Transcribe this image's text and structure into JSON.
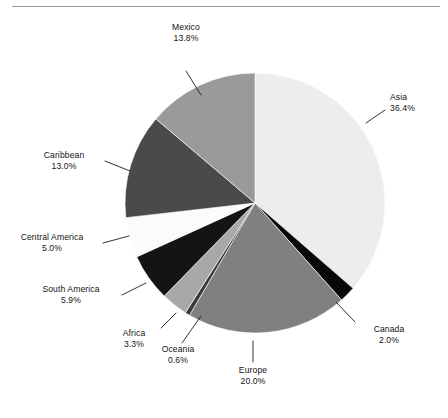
{
  "figure": {
    "background_color": "#ffffff",
    "rule_color": "#9a9a9a",
    "label_text_color": "#141414",
    "leader_color": "#1d1d1d"
  },
  "caption": {
    "text": ""
  },
  "chart_data": {
    "type": "pie",
    "title": "",
    "subtitle": "",
    "xlabel": "",
    "ylabel": "",
    "legend_position": "none",
    "grid": false,
    "start_angle_deg": 0,
    "direction": "clockwise",
    "center": {
      "x": 255,
      "y": 203
    },
    "radius": 130,
    "units": "percent",
    "total": 100.0,
    "categories": [
      "Asia",
      "Canada",
      "Europe",
      "Oceania",
      "Africa",
      "South America",
      "Central America",
      "Caribbean",
      "Mexico"
    ],
    "values": [
      36.4,
      2.0,
      20.0,
      0.6,
      3.3,
      5.9,
      5.0,
      13.0,
      13.8
    ],
    "value_labels": [
      "36.4%",
      "2.0%",
      "20.0%",
      "0.6%",
      "3.3%",
      "5.9%",
      "5.0%",
      "13.0%",
      "13.8%"
    ],
    "colors": [
      "#ededed",
      "#080808",
      "#808080",
      "#3a3a3a",
      "#a8a8a8",
      "#141414",
      "#fbfbfb",
      "#4a4a4a",
      "#9a9a9a"
    ],
    "slices": [
      {
        "name": "Asia",
        "value": 36.4,
        "label": "Asia",
        "value_label": "36.4%",
        "color": "#ededed"
      },
      {
        "name": "Canada",
        "value": 2.0,
        "label": "Canada",
        "value_label": "2.0%",
        "color": "#080808"
      },
      {
        "name": "Europe",
        "value": 20.0,
        "label": "Europe",
        "value_label": "20.0%",
        "color": "#808080"
      },
      {
        "name": "Oceania",
        "value": 0.6,
        "label": "Oceania",
        "value_label": "0.6%",
        "color": "#3a3a3a"
      },
      {
        "name": "Africa",
        "value": 3.3,
        "label": "Africa",
        "value_label": "3.3%",
        "color": "#a8a8a8"
      },
      {
        "name": "South America",
        "value": 5.9,
        "label": "South America",
        "value_label": "5.9%",
        "color": "#141414"
      },
      {
        "name": "Central America",
        "value": 5.0,
        "label": "Central America",
        "value_label": "5.0%",
        "color": "#fbfbfb"
      },
      {
        "name": "Caribbean",
        "value": 13.0,
        "label": "Caribbean",
        "value_label": "13.0%",
        "color": "#4a4a4a"
      },
      {
        "name": "Mexico",
        "value": 13.8,
        "label": "Mexico",
        "value_label": "13.8%",
        "color": "#9a9a9a"
      }
    ]
  },
  "labels": {
    "mexico": {
      "name": "Mexico",
      "value": "13.8%"
    },
    "asia": {
      "name": "Asia",
      "value": "36.4%"
    },
    "caribbean": {
      "name": "Caribbean",
      "value": "13.0%"
    },
    "central_america": {
      "name": "Central America",
      "value": "5.0%"
    },
    "south_america": {
      "name": "South America",
      "value": "5.9%"
    },
    "africa": {
      "name": "Africa",
      "value": "3.3%"
    },
    "oceania": {
      "name": "Oceania",
      "value": "0.6%"
    },
    "europe": {
      "name": "Europe",
      "value": "20.0%"
    },
    "canada": {
      "name": "Canada",
      "value": "2.0%"
    }
  }
}
